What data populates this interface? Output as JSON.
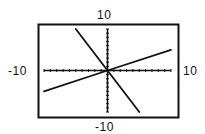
{
  "chart_data": {
    "type": "line",
    "title": "",
    "xlabel": "",
    "ylabel": "",
    "xlim": [
      -10,
      10
    ],
    "ylim": [
      -10,
      10
    ],
    "grid": false,
    "tick_marks": "every 1 unit on both axes",
    "window_labels": {
      "top": "10",
      "bottom": "-10",
      "left": "-10",
      "right": "10"
    },
    "series": [
      {
        "name": "steep decreasing line",
        "equation": "y = -2x",
        "x": [
          -5,
          0,
          5
        ],
        "y": [
          10,
          0,
          -10
        ]
      },
      {
        "name": "shallow increasing line",
        "equation": "y = 0.5x",
        "x": [
          -10,
          0,
          10
        ],
        "y": [
          -5,
          0,
          5
        ]
      }
    ]
  }
}
